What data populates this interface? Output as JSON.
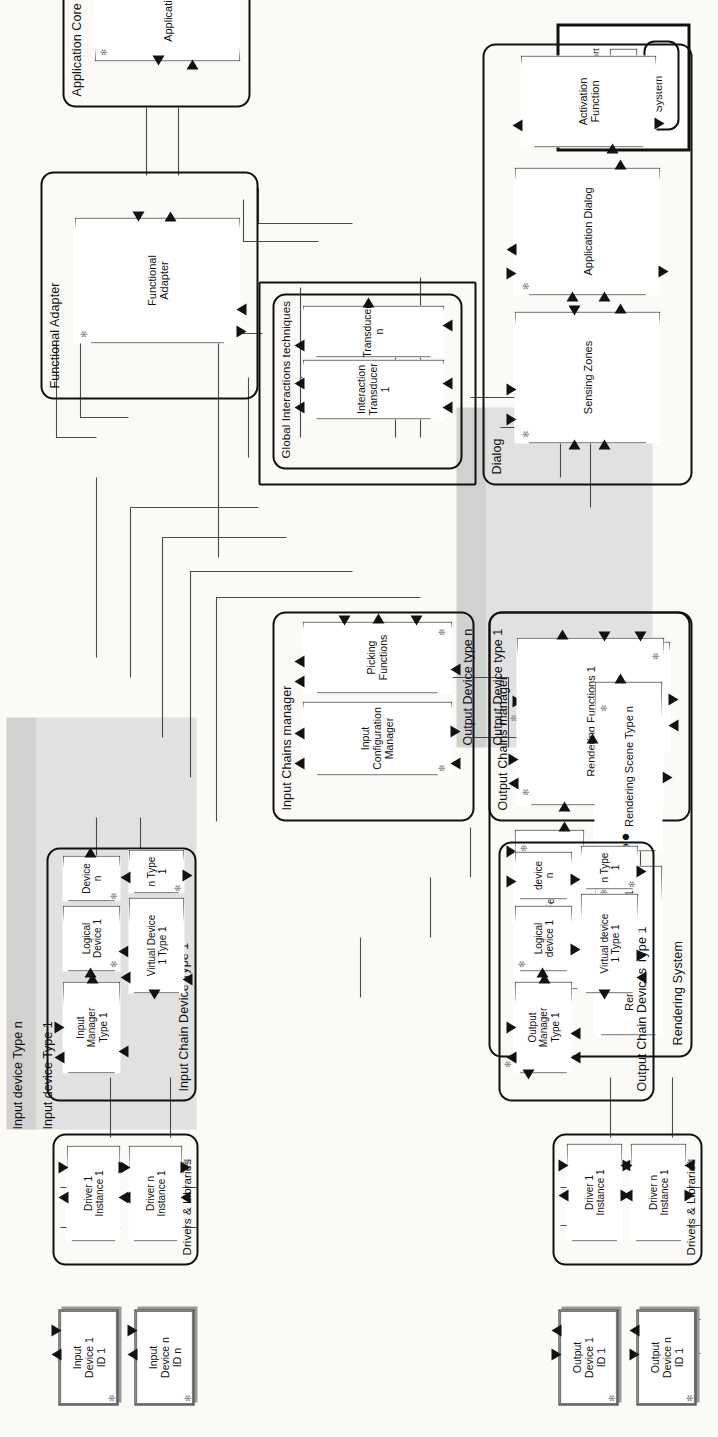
{
  "diagram": {
    "orientation": "rotated-90-ccw",
    "key": {
      "title": "KEY",
      "event_data_port": "Event + Data port",
      "process": "Process",
      "system": "System"
    },
    "systems": [
      {
        "id": "functional-adapter",
        "title": "Functional Adapter",
        "processes": [
          {
            "id": "functional-adapter-proc",
            "label": "Functional\nAdapter"
          }
        ]
      },
      {
        "id": "application-core",
        "title": "Application Core",
        "processes": [
          {
            "id": "application-core-proc",
            "label": "Application Core"
          }
        ]
      },
      {
        "id": "global-interactions-techniques",
        "title": "Global Interactions techniques",
        "processes": [
          {
            "id": "interaction-transducer-1",
            "label": "Interaction\nTransducer 1"
          },
          {
            "id": "transducer-n",
            "label": "Transducer n"
          }
        ]
      },
      {
        "id": "dialog",
        "title": "Dialog",
        "processes": [
          {
            "id": "sensing-zones",
            "label": "Sensing Zones"
          },
          {
            "id": "application-dialog",
            "label": "Application Dialog"
          },
          {
            "id": "activation-function",
            "label": "Activation\nFunction"
          }
        ]
      },
      {
        "id": "input-chains-manager",
        "title": "Input Chains manager",
        "processes": [
          {
            "id": "input-configuration-manager",
            "label": "Input\nConfiguration\nManager"
          },
          {
            "id": "picking-functions",
            "label": "Picking\nFunctions"
          }
        ]
      },
      {
        "id": "output-chains-manager",
        "title": "Output Chains manager",
        "processes": [
          {
            "id": "output-configuration-manager",
            "label": "Output\nConfiguration\nManager"
          }
        ]
      },
      {
        "id": "rendering-system",
        "title": "Rendering System",
        "processes": [
          {
            "id": "rendering-functions-1",
            "label": "Rendering Functions 1"
          },
          {
            "id": "immediate-feedback-1",
            "label": "Immediate Feedback 1"
          },
          {
            "id": "rendering-scene-type-1",
            "label": "Rendering Scene Type 1"
          },
          {
            "id": "rendering-scene-type-n",
            "label": "Rendering Scene Type n"
          },
          {
            "id": "rendering-scene-ellipsis",
            "label": "●●●"
          }
        ]
      },
      {
        "id": "input-chain-device-type-1",
        "title": "Input Chain Device Type 1",
        "processes": [
          {
            "id": "input-manager-type-1",
            "label": "Input\nManager\nType 1"
          },
          {
            "id": "logical-device-1",
            "label": "Logical\nDevice 1"
          },
          {
            "id": "logical-device-n",
            "label": "Device n"
          },
          {
            "id": "virtual-device-1-type-1",
            "label": "Virtual Device\n1 Type 1"
          },
          {
            "id": "virtual-device-n-type-1",
            "label": "n Type 1"
          }
        ]
      },
      {
        "id": "output-chain-devices-type-1",
        "title": "Output Chain Devices Type 1",
        "processes": [
          {
            "id": "output-manager-type-1",
            "label": "Output\nManager\nType 1"
          },
          {
            "id": "output-logical-device-1",
            "label": "Logical\ndevice 1"
          },
          {
            "id": "output-logical-device-n",
            "label": "device n"
          },
          {
            "id": "output-virtual-device-1-type-1",
            "label": "Virtual device\n1 Type 1"
          },
          {
            "id": "output-virtual-device-n-type-1",
            "label": "n Type 1"
          }
        ]
      },
      {
        "id": "input-drivers-libraries",
        "title": "Drivers & Libraries",
        "processes": [
          {
            "id": "input-driver-1-instance-1",
            "label": "Driver 1\nInstance 1"
          },
          {
            "id": "input-driver-n-instance-1",
            "label": "Driver n\nInstance 1"
          }
        ]
      },
      {
        "id": "output-drivers-libraries",
        "title": "Drivers & Libraries",
        "processes": [
          {
            "id": "output-driver-1-instance-1",
            "label": "Driver 1\nInstance 1"
          },
          {
            "id": "output-driver-n-instance-1",
            "label": "Driver n\nInstance 1"
          }
        ]
      }
    ],
    "devices": [
      {
        "id": "input-device-1-id-1",
        "label": "Input\nDevice 1\nID 1"
      },
      {
        "id": "input-device-n-id-n",
        "label": "Input\nDevice n\nID n"
      },
      {
        "id": "output-device-1-id-1",
        "label": "Output\nDevice 1\nID 1"
      },
      {
        "id": "output-device-n-id-1",
        "label": "Output\nDevice n\nID 1"
      }
    ],
    "captions": {
      "input_device_type_n": "Input device Type n",
      "input_device_type_1": "Input device Type 1",
      "output_device_type_n": "Output Device type n",
      "output_device_type_1": "Output Device type 1"
    },
    "colors": {
      "ink": "#111111",
      "wire": "#4a4a4a",
      "band_dark": "#c9c9c9",
      "band_light": "#dedede",
      "paper": "#fbfaf7"
    }
  }
}
